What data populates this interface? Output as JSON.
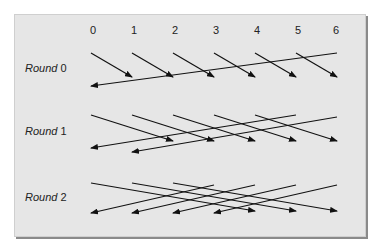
{
  "diagram": {
    "columns": [
      "0",
      "1",
      "2",
      "3",
      "4",
      "5",
      "6"
    ],
    "rounds": [
      {
        "word": "Round",
        "number": "0"
      },
      {
        "word": "Round",
        "number": "1"
      },
      {
        "word": "Round",
        "number": "2"
      }
    ],
    "colors": {
      "panel": "#e6e6e6",
      "line": "#111111",
      "text": "#222222"
    },
    "edges": {
      "round0": [
        [
          0,
          1
        ],
        [
          1,
          2
        ],
        [
          2,
          3
        ],
        [
          3,
          4
        ],
        [
          4,
          5
        ],
        [
          5,
          6
        ],
        [
          6,
          0
        ]
      ],
      "round1": [
        [
          0,
          2
        ],
        [
          1,
          3
        ],
        [
          2,
          4
        ],
        [
          3,
          5
        ],
        [
          4,
          6
        ],
        [
          5,
          0
        ],
        [
          6,
          1
        ]
      ],
      "round2": [
        [
          0,
          4
        ],
        [
          1,
          5
        ],
        [
          2,
          6
        ],
        [
          3,
          0
        ],
        [
          4,
          1
        ],
        [
          5,
          2
        ],
        [
          6,
          3
        ]
      ]
    }
  }
}
